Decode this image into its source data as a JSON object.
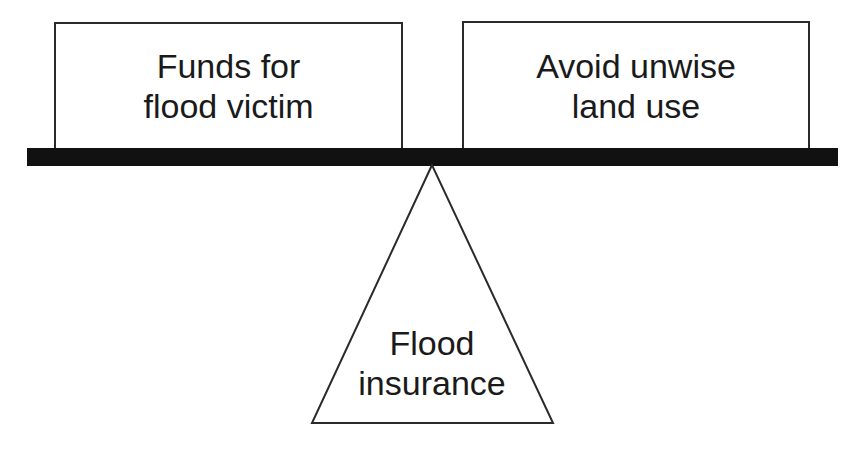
{
  "diagram": {
    "type": "balance-scale",
    "left_weight": {
      "lines": [
        "Funds for",
        "flood victim"
      ]
    },
    "right_weight": {
      "lines": [
        "Avoid unwise",
        "land use"
      ]
    },
    "fulcrum": {
      "lines": [
        "Flood",
        "insurance"
      ]
    },
    "colors": {
      "beam": "#111111",
      "outline": "#2a2a2a",
      "background": "#ffffff"
    }
  }
}
